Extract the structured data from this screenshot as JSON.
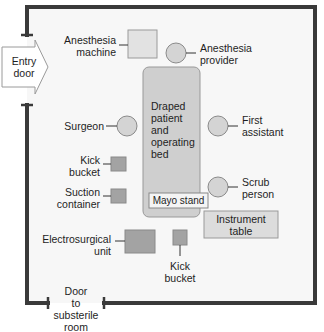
{
  "diagram": {
    "colors": {
      "wall": "#3a3a3a",
      "floor": "#f7f7f7",
      "bed_fill": "#cfcfcf",
      "person_fill": "#d4d4d4",
      "equipment_dark": "#a3a3a3",
      "equipment_light": "#dcdcdc",
      "outline": "#8a8a8a"
    },
    "doors": {
      "entry": "Entry door",
      "entry_line1": "Entry",
      "entry_line2": "door",
      "substerile_line1": "Door",
      "substerile_line2": "to",
      "substerile_line3": "substerile",
      "substerile_line4": "room"
    },
    "equipment": {
      "anesthesia_machine_line1": "Anesthesia",
      "anesthesia_machine_line2": "machine",
      "bed_line1": "Draped",
      "bed_line2": "patient",
      "bed_line3": "and",
      "bed_line4": "operating",
      "bed_line5": "bed",
      "mayo_stand": "Mayo stand",
      "kick_bucket_1_line1": "Kick",
      "kick_bucket_1_line2": "bucket",
      "suction_line1": "Suction",
      "suction_line2": "container",
      "electrosurgical_line1": "Electrosurgical",
      "electrosurgical_line2": "unit",
      "kick_bucket_2_line1": "Kick",
      "kick_bucket_2_line2": "bucket",
      "instrument_table_line1": "Instrument",
      "instrument_table_line2": "table"
    },
    "personnel": {
      "anesthesia_provider_line1": "Anesthesia",
      "anesthesia_provider_line2": "provider",
      "surgeon": "Surgeon",
      "first_assistant_line1": "First",
      "first_assistant_line2": "assistant",
      "scrub_person_line1": "Scrub",
      "scrub_person_line2": "person"
    }
  }
}
